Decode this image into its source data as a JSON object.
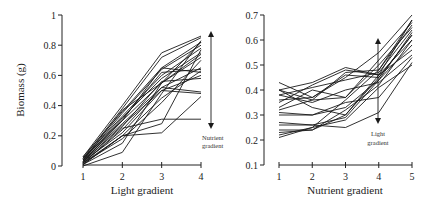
{
  "chart_data": [
    {
      "type": "line",
      "title": "",
      "xlabel": "Light gradient",
      "ylabel": "Biomass (g)",
      "x": [
        1,
        2,
        3,
        4
      ],
      "xticks": [
        "1",
        "2",
        "3",
        "4"
      ],
      "yticks": [
        "0",
        "0.2",
        "0.4",
        "0.6",
        "0.8",
        "1"
      ],
      "ylim": [
        0,
        1
      ],
      "grid": false,
      "legend": null,
      "annotation": {
        "text_line1": "Nutrient",
        "text_line2": "gradient",
        "arrow": "double-headed vertical at x=4, spanning ~0.47 to ~0.85"
      },
      "series": [
        {
          "name": "s1",
          "values": [
            0.06,
            0.4,
            0.75,
            0.86
          ]
        },
        {
          "name": "s2",
          "values": [
            0.05,
            0.38,
            0.72,
            0.85
          ]
        },
        {
          "name": "s3",
          "values": [
            0.06,
            0.36,
            0.65,
            0.82
          ]
        },
        {
          "name": "s4",
          "values": [
            0.04,
            0.35,
            0.64,
            0.8
          ]
        },
        {
          "name": "s5",
          "values": [
            0.05,
            0.33,
            0.6,
            0.78
          ]
        },
        {
          "name": "s6",
          "values": [
            0.04,
            0.32,
            0.58,
            0.75
          ]
        },
        {
          "name": "s7",
          "values": [
            0.03,
            0.3,
            0.55,
            0.74
          ]
        },
        {
          "name": "s8",
          "values": [
            0.05,
            0.3,
            0.65,
            0.62
          ]
        },
        {
          "name": "s9",
          "values": [
            0.04,
            0.28,
            0.52,
            0.65
          ]
        },
        {
          "name": "s10",
          "values": [
            0.03,
            0.27,
            0.5,
            0.6
          ]
        },
        {
          "name": "s11",
          "values": [
            0.03,
            0.26,
            0.56,
            0.58
          ]
        },
        {
          "name": "s12",
          "values": [
            0.02,
            0.24,
            0.52,
            0.49
          ]
        },
        {
          "name": "s13",
          "values": [
            0.03,
            0.22,
            0.5,
            0.48
          ]
        },
        {
          "name": "s14",
          "values": [
            0.02,
            0.2,
            0.45,
            0.63
          ]
        },
        {
          "name": "s15",
          "values": [
            0.02,
            0.18,
            0.42,
            0.7
          ]
        },
        {
          "name": "s16",
          "values": [
            0.01,
            0.2,
            0.28,
            0.77
          ]
        },
        {
          "name": "s17",
          "values": [
            0.02,
            0.25,
            0.31,
            0.31
          ]
        },
        {
          "name": "s18",
          "values": [
            0.01,
            0.2,
            0.22,
            0.46
          ]
        },
        {
          "name": "s19",
          "values": [
            0.0,
            0.09,
            0.48,
            0.83
          ]
        },
        {
          "name": "s20",
          "values": [
            0.01,
            0.15,
            0.55,
            0.72
          ]
        },
        {
          "name": "s21",
          "values": [
            0.04,
            0.37,
            0.55,
            0.82
          ]
        },
        {
          "name": "s22",
          "values": [
            0.03,
            0.31,
            0.62,
            0.64
          ]
        }
      ]
    },
    {
      "type": "line",
      "title": "",
      "xlabel": "Nutrient gradient",
      "ylabel": "",
      "x": [
        1,
        2,
        3,
        4,
        5
      ],
      "xticks": [
        "1",
        "2",
        "3",
        "4",
        "5"
      ],
      "yticks": [
        "0.1",
        "0.2",
        "0.3",
        "0.4",
        "0.5",
        "0.6",
        "0.7"
      ],
      "ylim": [
        0.1,
        0.7
      ],
      "grid": false,
      "legend": null,
      "annotation": {
        "text_line1": "Light",
        "text_line2": "gradient",
        "arrow": "double-headed vertical at x=4, spanning ~0.29 to ~0.63"
      },
      "series": [
        {
          "name": "s1",
          "values": [
            0.43,
            0.37,
            0.45,
            0.55,
            0.7
          ]
        },
        {
          "name": "s2",
          "values": [
            0.4,
            0.43,
            0.49,
            0.46,
            0.68
          ]
        },
        {
          "name": "s3",
          "values": [
            0.4,
            0.36,
            0.47,
            0.48,
            0.66
          ]
        },
        {
          "name": "s4",
          "values": [
            0.38,
            0.41,
            0.44,
            0.47,
            0.64
          ]
        },
        {
          "name": "s5",
          "values": [
            0.36,
            0.37,
            0.46,
            0.45,
            0.62
          ]
        },
        {
          "name": "s6",
          "values": [
            0.35,
            0.42,
            0.48,
            0.46,
            0.6
          ]
        },
        {
          "name": "s7",
          "values": [
            0.33,
            0.4,
            0.37,
            0.5,
            0.65
          ]
        },
        {
          "name": "s8",
          "values": [
            0.32,
            0.36,
            0.37,
            0.52,
            0.67
          ]
        },
        {
          "name": "s9",
          "values": [
            0.31,
            0.3,
            0.33,
            0.44,
            0.58
          ]
        },
        {
          "name": "s10",
          "values": [
            0.3,
            0.3,
            0.35,
            0.37,
            0.53
          ]
        },
        {
          "name": "s11",
          "values": [
            0.4,
            0.33,
            0.3,
            0.46,
            0.56
          ]
        },
        {
          "name": "s12",
          "values": [
            0.27,
            0.26,
            0.29,
            0.44,
            0.63
          ]
        },
        {
          "name": "s13",
          "values": [
            0.26,
            0.26,
            0.25,
            0.31,
            0.51
          ]
        },
        {
          "name": "s14",
          "values": [
            0.24,
            0.24,
            0.32,
            0.42,
            0.6
          ]
        },
        {
          "name": "s15",
          "values": [
            0.23,
            0.24,
            0.3,
            0.45,
            0.62
          ]
        },
        {
          "name": "s16",
          "values": [
            0.22,
            0.25,
            0.28,
            0.41,
            0.5
          ]
        },
        {
          "name": "s17",
          "values": [
            0.21,
            0.25,
            0.36,
            0.48,
            0.68
          ]
        },
        {
          "name": "s18",
          "values": [
            0.38,
            0.35,
            0.4,
            0.43,
            0.54
          ]
        }
      ]
    }
  ],
  "left_panel": {
    "ylabel": "Biomass (g)",
    "xlabel": "Light gradient",
    "annotation_line1": "Nutrient",
    "annotation_line2": "gradient"
  },
  "right_panel": {
    "xlabel": "Nutrient gradient",
    "annotation_line1": "Light",
    "annotation_line2": "gradient"
  }
}
